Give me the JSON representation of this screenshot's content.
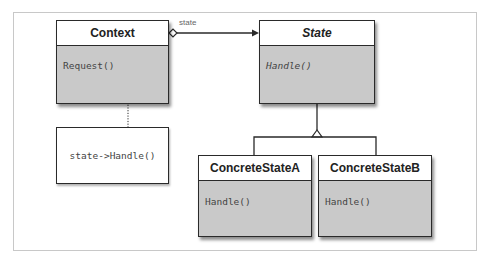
{
  "diagram": {
    "type": "UML class diagram",
    "classes": [
      {
        "name": "Context",
        "abstract": false,
        "operations": [
          "Request()"
        ]
      },
      {
        "name": "State",
        "abstract": true,
        "operations": [
          "Handle()"
        ]
      },
      {
        "name": "ConcreteStateA",
        "abstract": false,
        "operations": [
          "Handle()"
        ]
      },
      {
        "name": "ConcreteStateB",
        "abstract": false,
        "operations": [
          "Handle()"
        ]
      }
    ],
    "note": {
      "text": "state->Handle()",
      "attached_to": "Context.Request()"
    },
    "relations": [
      {
        "from": "Context",
        "to": "State",
        "kind": "aggregation",
        "label": "state"
      },
      {
        "from": "ConcreteStateA",
        "to": "State",
        "kind": "inheritance"
      },
      {
        "from": "ConcreteStateB",
        "to": "State",
        "kind": "inheritance"
      }
    ]
  },
  "colors": {
    "class_body": "#c9c9c9",
    "class_header": "#ffffff",
    "stroke": "#2a2a2a"
  }
}
